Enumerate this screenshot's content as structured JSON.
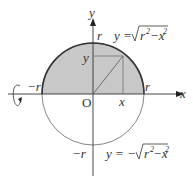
{
  "diagram": {
    "axes": {
      "x_label": "x",
      "y_label": "y",
      "origin_label": "O"
    },
    "labels": {
      "r_top": "r",
      "r_right": "r",
      "r_left": "−r",
      "r_bottom": "−r",
      "point_x": "x",
      "point_y": "y"
    },
    "upper_curve": {
      "lhs": "y =",
      "radicand_r": "r",
      "radicand_x": "−x",
      "exp": "2"
    },
    "lower_curve": {
      "lhs": "y = −",
      "radicand_r": "r",
      "radicand_x": "−x",
      "exp": "2"
    },
    "colors": {
      "shaded": "#c8c8c8",
      "line": "#444444",
      "background": "#ffffff"
    }
  }
}
